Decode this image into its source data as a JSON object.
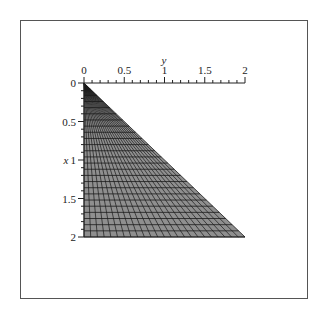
{
  "chart_data": {
    "type": "surface-mesh",
    "title": "",
    "xlabel": "x",
    "ylabel": "y",
    "x_axis": {
      "position": "left, pointing down",
      "range": [
        0,
        2
      ],
      "ticks": [
        "0",
        "0.5",
        "1",
        "1.5",
        "2"
      ],
      "tick_values": [
        0,
        0.5,
        1,
        1.5,
        2
      ]
    },
    "y_axis": {
      "position": "top, pointing right",
      "range": [
        0,
        2
      ],
      "ticks": [
        "0",
        "0.5",
        "1",
        "1.5",
        "2"
      ],
      "tick_values": [
        0,
        0.5,
        1,
        1.5,
        2
      ]
    },
    "region_vertices": [
      [
        0,
        0
      ],
      [
        2,
        0
      ],
      [
        2,
        2
      ]
    ],
    "mesh": {
      "rows": 25,
      "rays": 24
    },
    "grid": false,
    "legend": null,
    "colors": {
      "fill": "#8f8f8f",
      "mesh_line": "#1a1a1a",
      "axis": "#222222",
      "frame": "#555555"
    }
  },
  "labels": {
    "x_axis_title": "x",
    "y_axis_title": "y",
    "x_ticks": [
      "0",
      "0.5",
      "1",
      "1.5",
      "2"
    ],
    "y_ticks": [
      "0",
      "0.5",
      "1",
      "1.5",
      "2"
    ]
  }
}
